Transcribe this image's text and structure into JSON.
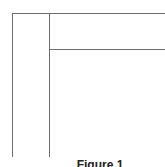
{
  "diagram": {
    "caption": "Figure 1",
    "line_color": "#6e6e6e",
    "elements": [
      {
        "type": "horizontal-line",
        "name": "top-border",
        "from": [
          12,
          13
        ],
        "to": [
          165,
          13
        ]
      },
      {
        "type": "vertical-line",
        "name": "left-border",
        "from": [
          12,
          13
        ],
        "to": [
          12,
          157
        ]
      },
      {
        "type": "vertical-line",
        "name": "inner-divider",
        "from": [
          49,
          13
        ],
        "to": [
          49,
          157
        ]
      },
      {
        "type": "horizontal-line",
        "name": "inner-header-divider",
        "from": [
          49,
          49
        ],
        "to": [
          165,
          49
        ]
      }
    ]
  }
}
